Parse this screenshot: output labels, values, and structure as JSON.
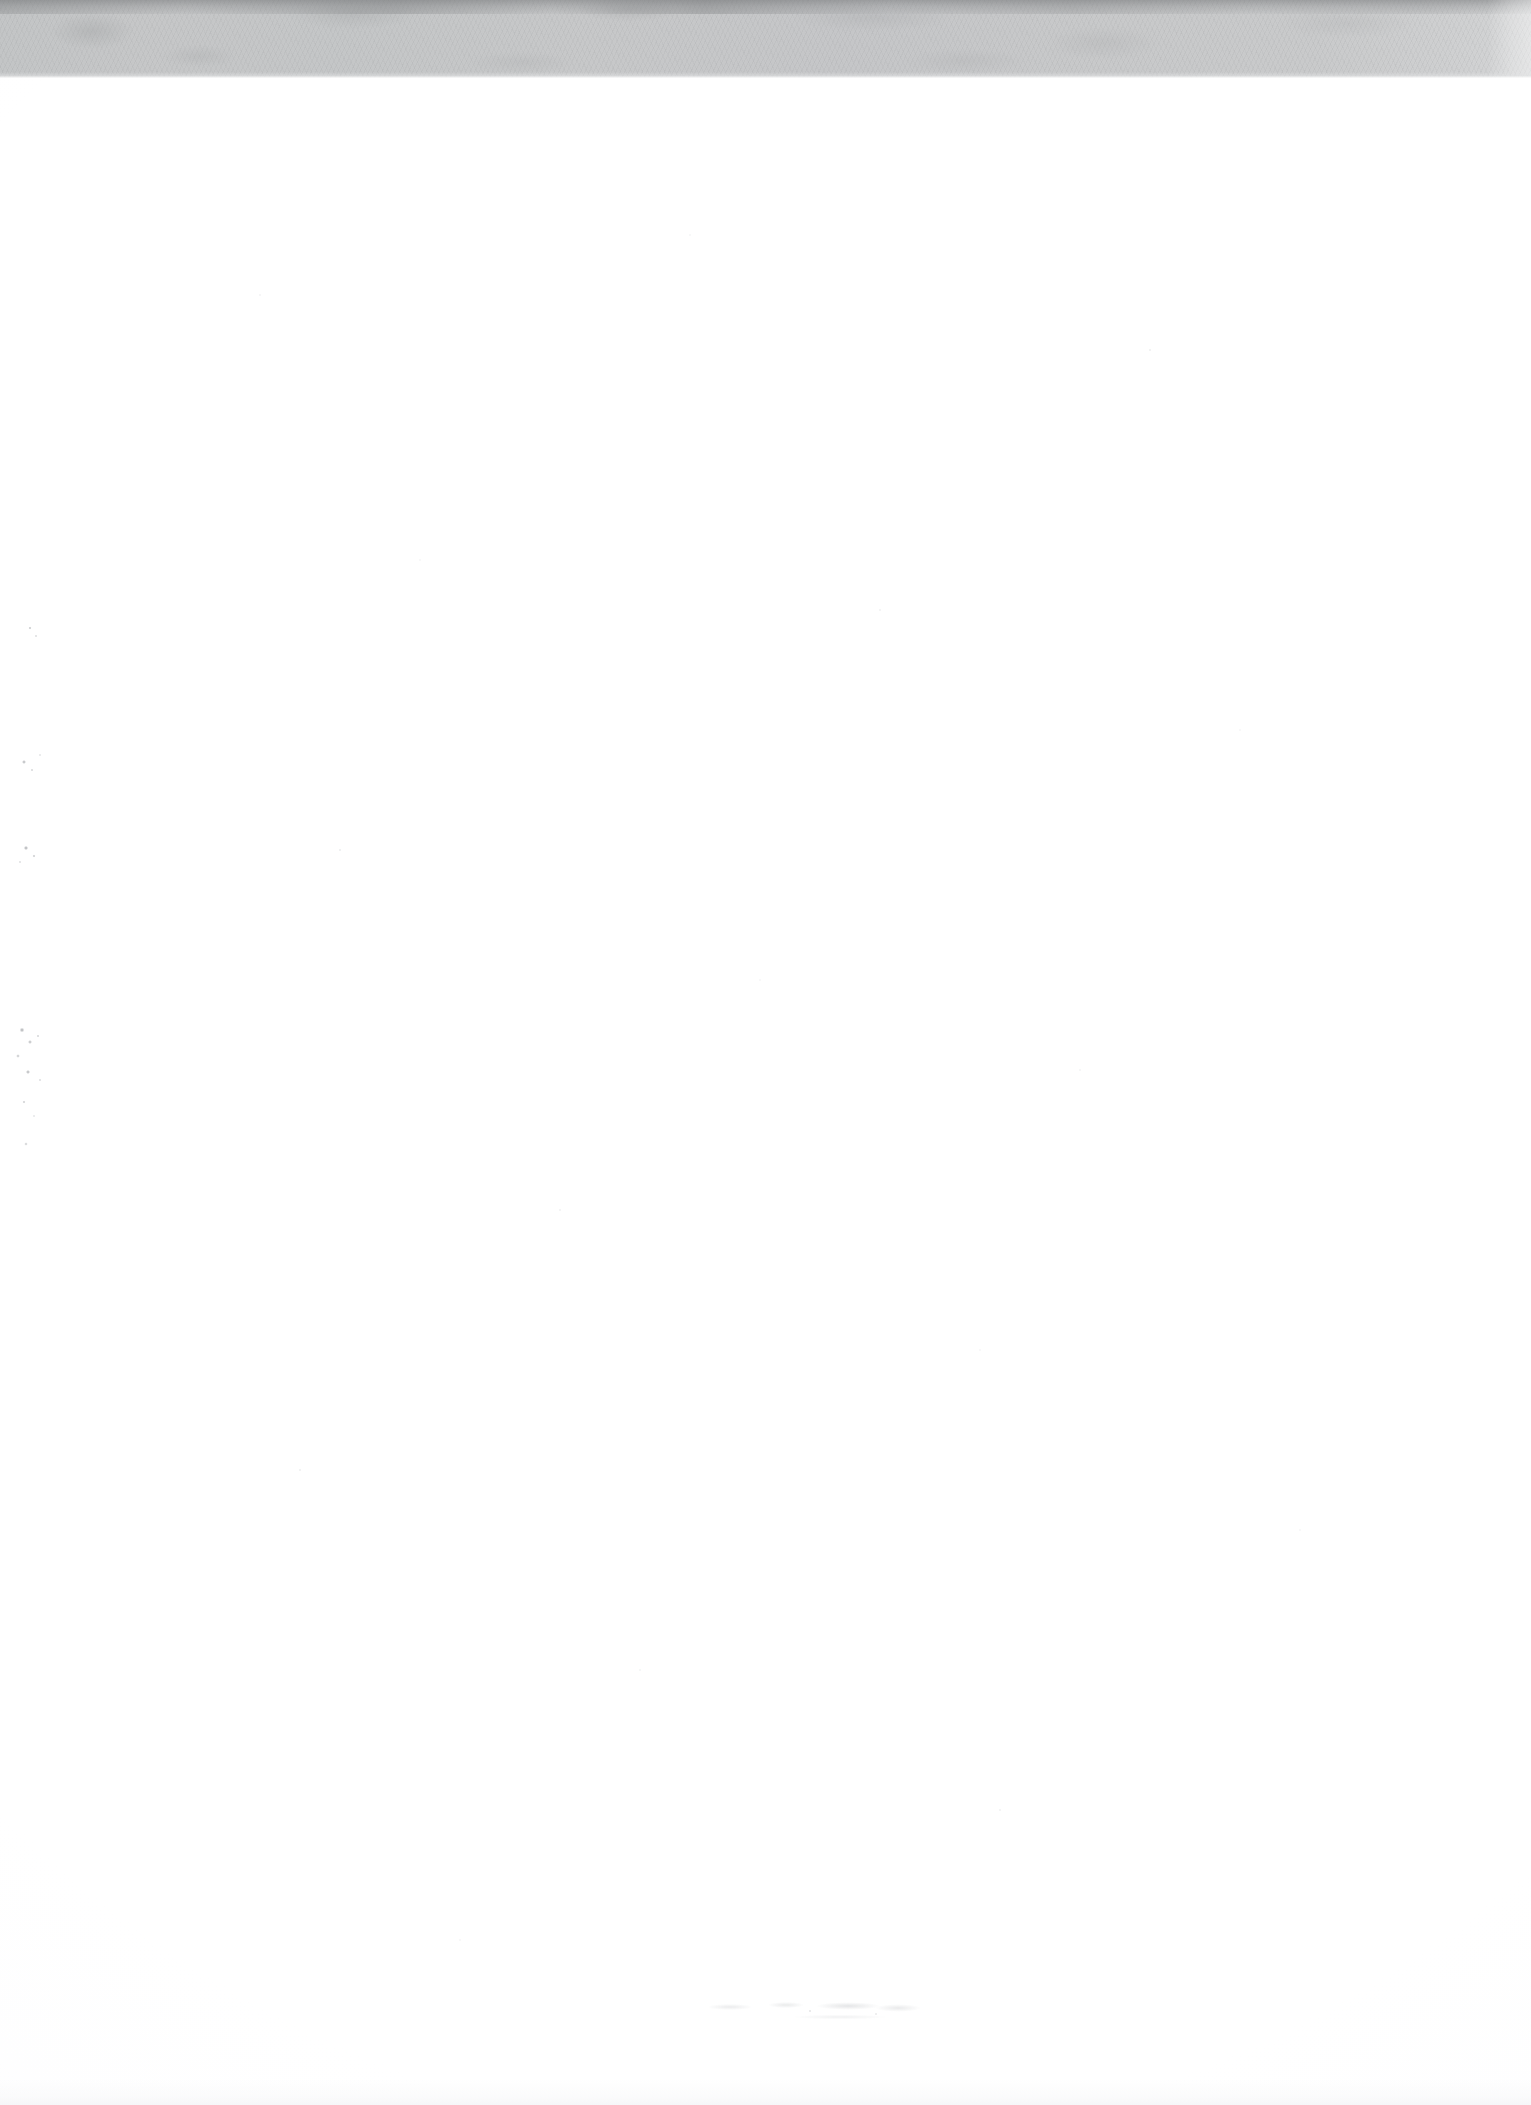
{
  "page": {
    "kind": "scanned-blank-page",
    "width_px": 1531,
    "height_px": 2105,
    "background_color": "#ffffff",
    "visible_text": "",
    "note": ""
  },
  "scan_band": {
    "name": "top-gray-band",
    "top_px": 0,
    "height_px": 78,
    "color": "#c6c7c8",
    "edge_streak_color": "#7c7e80",
    "right_light_color": "#d4d5d6",
    "label": ""
  },
  "artifacts": {
    "left_speckle_cluster": {
      "x_px": 6,
      "y_px": 610,
      "width_px": 60,
      "height_px": 600,
      "color": "#787c82",
      "label": ""
    },
    "bottom_ghost_mark": {
      "x_px": 690,
      "y_px": 1995,
      "width_px": 270,
      "height_px": 36,
      "color": "#a0a3a8",
      "label": ""
    },
    "dust_color": "#bec1c5"
  }
}
